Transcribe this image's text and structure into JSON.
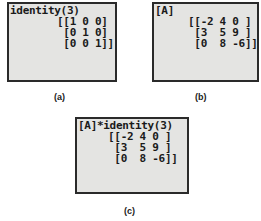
{
  "panels": [
    {
      "id": "a",
      "caption": "(a)",
      "command": "identity(3)",
      "rows": [
        "[[1 0 0]",
        " [0 1 0]",
        " [0 0 1]]"
      ]
    },
    {
      "id": "b",
      "caption": "(b)",
      "command": "[A]",
      "rows": [
        "[[-2 4 0 ]",
        " [3  5 9 ]",
        " [0  8 -6]]"
      ]
    },
    {
      "id": "c",
      "caption": "(c)",
      "command": "[A]*identity(3)",
      "rows": [
        "[[-2 4 0 ]",
        " [3  5 9 ]",
        " [0  8 -6]]"
      ]
    }
  ],
  "colors": {
    "screen_bg": "#e4e4e2",
    "border": "#2a2a2a",
    "text": "#1a1a1a"
  }
}
